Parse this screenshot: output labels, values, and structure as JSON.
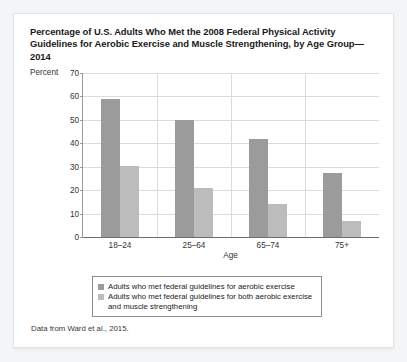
{
  "card": {
    "title": "Percentage of U.S. Adults Who Met the 2008 Federal Physical Activity Guidelines for Aerobic Exercise and Muscle Strengthening, by Age Group—2014",
    "source": "Data from Ward et al., 2015."
  },
  "chart_data": {
    "type": "bar",
    "title": "Percentage of U.S. Adults Who Met the 2008 Federal Physical Activity Guidelines for Aerobic Exercise and Muscle Strengthening, by Age Group—2014",
    "categories": [
      "18–24",
      "25–64",
      "65–74",
      "75+"
    ],
    "series": [
      {
        "name": "Adults who met federal guidelines for aerobic exercise",
        "color": "#9b9b9b",
        "values": [
          59,
          50,
          42,
          27.5
        ]
      },
      {
        "name": "Adults who met federal guidelines for both aerobic exercise and muscle strengthening",
        "color": "#bcbcbc",
        "values": [
          30.5,
          21,
          14,
          7
        ]
      }
    ],
    "xlabel": "Age",
    "ylabel": "Percent",
    "ylim": [
      0,
      70
    ],
    "yticks": [
      0,
      10,
      20,
      30,
      40,
      50,
      60,
      70
    ],
    "ytick_labels": [
      "0",
      "10",
      "20",
      "30",
      "40",
      "50",
      "60",
      "70"
    ],
    "grid": "horizontal-and-vertical",
    "legend_position": "bottom"
  },
  "legend": {
    "items": [
      "Adults who met federal guidelines for aerobic exercise",
      "Adults who met federal guidelines for both aerobic exercise and muscle strengthening"
    ]
  }
}
